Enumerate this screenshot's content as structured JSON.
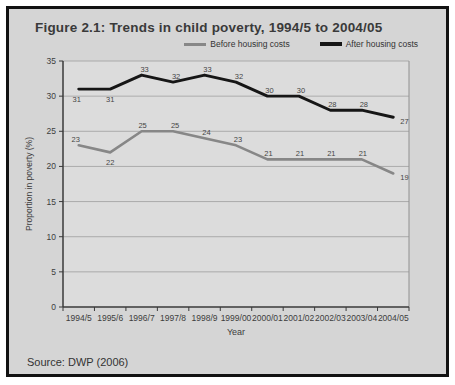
{
  "figure": {
    "title": "Figure 2.1: Trends in child poverty, 1994/5 to 2004/05",
    "source": "Source: DWP (2006)"
  },
  "chart_data": {
    "type": "line",
    "title": "Figure 2.1: Trends in child poverty, 1994/5 to 2004/05",
    "categories": [
      "1994/5",
      "1995/6",
      "1996/7",
      "1997/8",
      "1998/9",
      "1999/00",
      "2000/01",
      "2001/02",
      "2002/03",
      "2003/04",
      "2004/05"
    ],
    "series": [
      {
        "name": "Before housing costs",
        "color": "#878787",
        "values": [
          23,
          22,
          25,
          25,
          24,
          23,
          21,
          21,
          21,
          21,
          19
        ]
      },
      {
        "name": "After housing costs",
        "color": "#161616",
        "values": [
          31,
          31,
          33,
          32,
          33,
          32,
          30,
          30,
          28,
          28,
          27
        ]
      }
    ],
    "xlabel": "Year",
    "ylabel": "Proportion in poverty (%)",
    "ylim": [
      0,
      35
    ],
    "ytick_step": 5,
    "grid": true,
    "data_labels": true,
    "legend_position": "top-right",
    "colors": {
      "figure_background": "#d5d5d5",
      "plot_background": "#dcdcdc",
      "gridline": "#9e9e9e",
      "axis": "#3a3a3a",
      "label_text": "#454545"
    }
  }
}
